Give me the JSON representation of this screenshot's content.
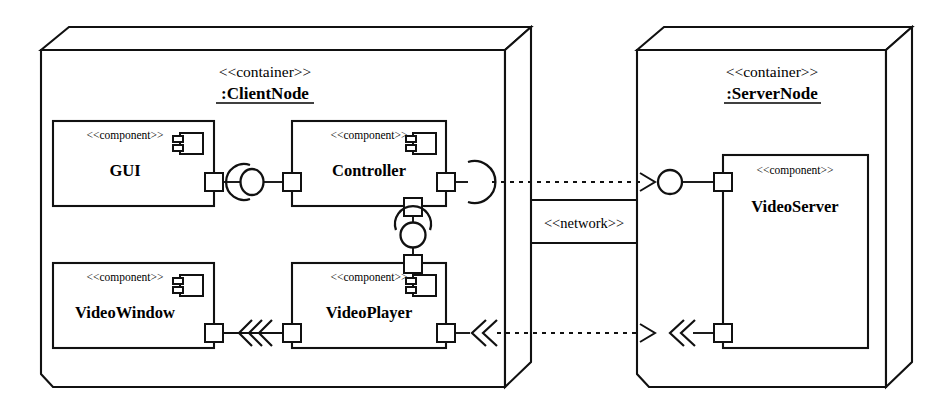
{
  "diagram": {
    "type": "uml-deployment-component-diagram",
    "background_color": "#ffffff",
    "line_color": "#111111"
  },
  "nodes": [
    {
      "id": "client-node",
      "stereotype": "<<container>>",
      "name": ":ClientNode",
      "shape": "3d-box"
    },
    {
      "id": "server-node",
      "stereotype": "<<container>>",
      "name": ":ServerNode",
      "shape": "3d-box"
    }
  ],
  "components": [
    {
      "id": "gui",
      "stereotype": "<<component>>",
      "name": "GUI",
      "parent": "client-node",
      "has_component_icon": true
    },
    {
      "id": "controller",
      "stereotype": "<<component>>",
      "name": "Controller",
      "parent": "client-node",
      "has_component_icon": true
    },
    {
      "id": "video-window",
      "stereotype": "<<component>>",
      "name": "VideoWindow",
      "parent": "client-node",
      "has_component_icon": true
    },
    {
      "id": "video-player",
      "stereotype": "<<component>>",
      "name": "VideoPlayer",
      "parent": "client-node",
      "has_component_icon": true
    },
    {
      "id": "video-server",
      "stereotype": "<<component>>",
      "name": "VideoServer",
      "parent": "server-node",
      "has_component_icon": false
    }
  ],
  "connectors": [
    {
      "id": "gui-controller",
      "kind": "ball-and-socket-assembly",
      "from": "gui",
      "to": "controller",
      "orientation": "horizontal"
    },
    {
      "id": "controller-videoplayer",
      "kind": "ball-and-socket-assembly",
      "from": "controller",
      "to": "video-player",
      "orientation": "vertical"
    },
    {
      "id": "controller-videoserver",
      "kind": "socket-to-ball-dependency",
      "from": "controller",
      "to": "video-server",
      "label": "<<network>>"
    },
    {
      "id": "videoplayer-videowindow",
      "kind": "stream-flow-triple-chevron",
      "from": "video-player",
      "to": "video-window"
    },
    {
      "id": "videoserver-videoplayer",
      "kind": "stream-flow-double-chevron-dependency",
      "from": "video-server",
      "to": "video-player",
      "label": "<<network>>"
    }
  ],
  "communication_path": {
    "id": "network-path",
    "label": "<<network>>",
    "between": [
      "client-node",
      "server-node"
    ]
  }
}
